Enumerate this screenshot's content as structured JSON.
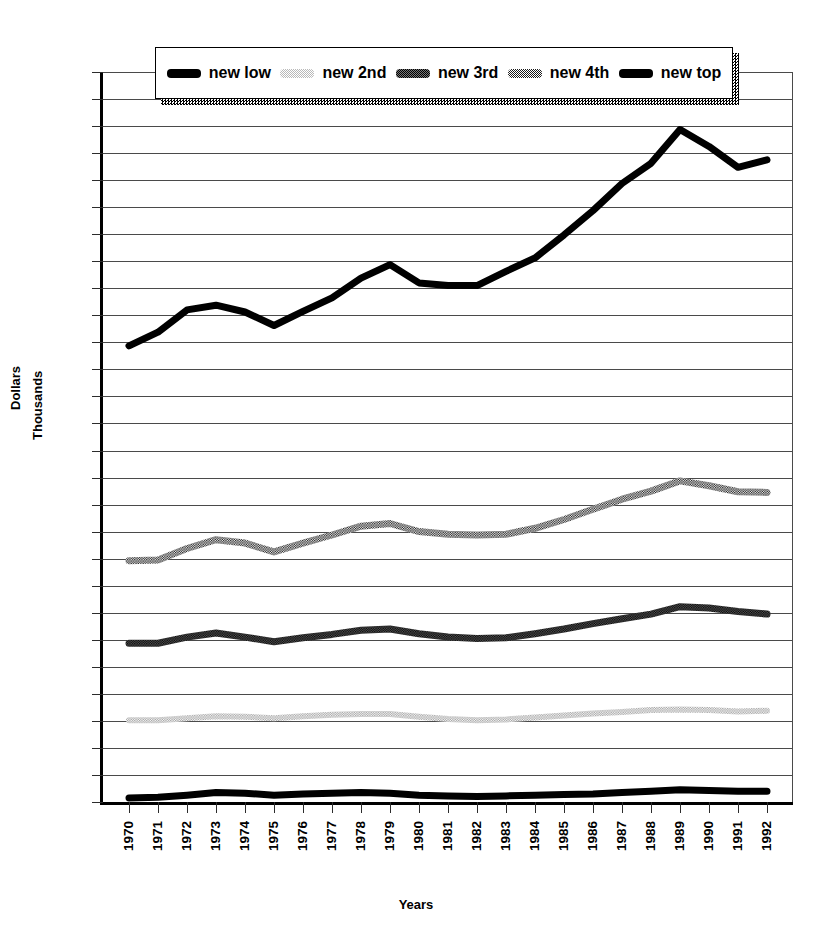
{
  "chart_data": {
    "type": "line",
    "title": "",
    "xlabel": "Years",
    "ylabel": "Dollars Thousands",
    "ylabel_lines": [
      "Dollars",
      "Thousands"
    ],
    "ylim": [
      6,
      114
    ],
    "ytick_step": 4,
    "yticks": [
      6,
      10,
      14,
      18,
      22,
      26,
      30,
      34,
      38,
      42,
      46,
      50,
      54,
      58,
      62,
      66,
      70,
      74,
      78,
      82,
      86,
      90,
      94,
      98,
      102,
      106,
      110,
      114
    ],
    "grid": true,
    "legend_position": "top",
    "categories": [
      "1970",
      "1971",
      "1972",
      "1973",
      "1974",
      "1975",
      "1976",
      "1977",
      "1978",
      "1979",
      "1980",
      "1981",
      "1982",
      "1983",
      "1984",
      "1985",
      "1986",
      "1987",
      "1988",
      "1989",
      "1990",
      "1991",
      "1992"
    ],
    "series": [
      {
        "name": "new low",
        "style": "solid-black",
        "color": "#000000",
        "values": [
          6.6,
          6.7,
          7.0,
          7.4,
          7.3,
          7.0,
          7.2,
          7.3,
          7.4,
          7.3,
          7.0,
          6.9,
          6.8,
          6.9,
          7.0,
          7.1,
          7.2,
          7.4,
          7.6,
          7.8,
          7.7,
          7.6,
          7.6
        ]
      },
      {
        "name": "new 2nd",
        "style": "light-dither",
        "color": "#b9b9b9",
        "values": [
          18.1,
          18.1,
          18.4,
          18.7,
          18.6,
          18.4,
          18.7,
          18.9,
          19.0,
          19.0,
          18.6,
          18.3,
          18.1,
          18.2,
          18.5,
          18.8,
          19.1,
          19.3,
          19.6,
          19.7,
          19.6,
          19.4,
          19.5
        ]
      },
      {
        "name": "new 3rd",
        "style": "dark-dither",
        "color": "#1a1a1a",
        "values": [
          29.5,
          29.5,
          30.4,
          31.0,
          30.4,
          29.7,
          30.3,
          30.8,
          31.4,
          31.6,
          30.9,
          30.4,
          30.2,
          30.3,
          30.9,
          31.6,
          32.4,
          33.1,
          33.8,
          34.9,
          34.7,
          34.2,
          33.8
        ]
      },
      {
        "name": "new 4th",
        "style": "med-dither",
        "color": "#2a2a2a",
        "values": [
          41.7,
          41.8,
          43.5,
          44.8,
          44.3,
          43.0,
          44.3,
          45.5,
          46.8,
          47.2,
          46.0,
          45.6,
          45.5,
          45.6,
          46.5,
          47.8,
          49.3,
          50.8,
          52.0,
          53.5,
          52.8,
          51.9,
          51.8
        ]
      },
      {
        "name": "new top",
        "style": "solid-black",
        "color": "#000000",
        "values": [
          73.5,
          75.5,
          78.8,
          79.5,
          78.5,
          76.5,
          78.6,
          80.6,
          83.5,
          85.5,
          82.8,
          82.4,
          82.4,
          84.5,
          86.5,
          89.9,
          93.5,
          97.5,
          100.5,
          105.5,
          103.0,
          99.9,
          101.0
        ]
      }
    ]
  },
  "legend": {
    "items": [
      {
        "label": "new low",
        "pattern": "pat-solid"
      },
      {
        "label": "new 2nd",
        "pattern": "pat-light"
      },
      {
        "label": "new 3rd",
        "pattern": "pat-darkdot"
      },
      {
        "label": "new 4th",
        "pattern": "pat-med"
      },
      {
        "label": "new top",
        "pattern": "pat-solid"
      }
    ]
  }
}
